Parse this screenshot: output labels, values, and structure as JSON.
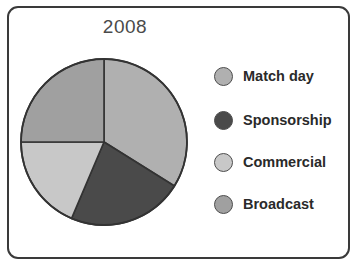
{
  "figure": {
    "title": "2008",
    "frame_border_color": "#3a3a3a",
    "background_color": "#ffffff"
  },
  "chart_data": {
    "type": "pie",
    "title": "2008",
    "xlabel": "",
    "ylabel": "",
    "categories": [
      "Match day",
      "Sponsorship",
      "Commercial",
      "Broadcast"
    ],
    "values": [
      34,
      22.5,
      18.5,
      25
    ],
    "unit": "percent",
    "start_angle_deg": 0,
    "direction": "clockwise",
    "slice_boundaries_deg": [
      0,
      122,
      203,
      270,
      360
    ],
    "colors": [
      "#b0b0b0",
      "#4a4a4a",
      "#c8c8c8",
      "#a0a0a0"
    ],
    "slice_edge_color": "#333333",
    "legend_position": "right",
    "grid": false,
    "series": [
      {
        "name": "Revenue share 2008",
        "values": [
          34,
          22.5,
          18.5,
          25
        ]
      }
    ]
  },
  "legend": {
    "items": [
      {
        "label": "Match day",
        "color": "#b0b0b0"
      },
      {
        "label": "Sponsorship",
        "color": "#4a4a4a"
      },
      {
        "label": "Commercial",
        "color": "#c8c8c8"
      },
      {
        "label": "Broadcast",
        "color": "#a0a0a0"
      }
    ]
  }
}
